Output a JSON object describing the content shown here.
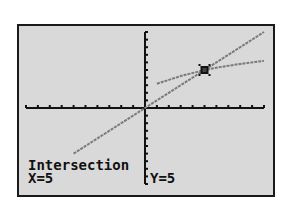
{
  "calculator_screen": {
    "mode": "graph",
    "status_label": "Intersection",
    "x_readout": "X=5",
    "y_readout": "Y=5",
    "colors": {
      "screen_bg": "#d9d9d9",
      "frame": "#1a1a1a",
      "axes": "#111111",
      "graph_line": "#7a7a7a",
      "text": "#111111"
    }
  },
  "chart_data": {
    "type": "line",
    "title": "",
    "xlabel": "",
    "ylabel": "",
    "xlim": [
      -10,
      10
    ],
    "ylim": [
      -10,
      10
    ],
    "grid": false,
    "axis_ticks": {
      "x_step": 1,
      "y_step": 1
    },
    "series": [
      {
        "name": "Y1 (line)",
        "x": [
          -6,
          -4,
          -2,
          0,
          2,
          4,
          5,
          6,
          8,
          10
        ],
        "y": [
          -6,
          -4,
          -2,
          0,
          2,
          4,
          5,
          6,
          8,
          10
        ]
      },
      {
        "name": "Y2 (curve)",
        "x": [
          1,
          2,
          3,
          4,
          5,
          6,
          8,
          10
        ],
        "y": [
          3.2,
          3.7,
          4.2,
          4.6,
          5,
          5.3,
          5.8,
          6.2
        ]
      }
    ],
    "annotations": [
      {
        "text": "Intersection",
        "x": 5,
        "y": 5
      }
    ]
  }
}
